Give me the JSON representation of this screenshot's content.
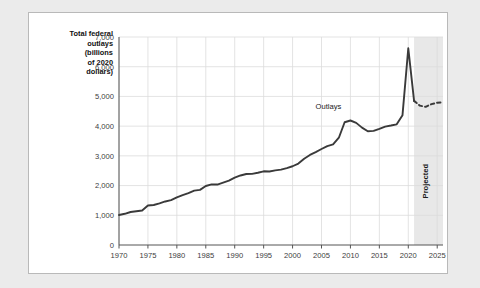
{
  "figure": {
    "y_axis_title": [
      "Total federal",
      "outlays",
      "(billions",
      "of 2020",
      "dollars)"
    ],
    "series_annotation": "Outlays",
    "projected_annotation": "Projected",
    "line_color": "#3a3a3a",
    "grid_color": "#dcdcdc",
    "shade_color": "#e8e8e8",
    "axis_color": "#555555"
  },
  "chart_data": {
    "type": "line",
    "title": "",
    "xlabel": "",
    "ylabel": "Total federal outlays (billions of 2020 dollars)",
    "xlim": [
      1970,
      2026
    ],
    "ylim": [
      0,
      7000
    ],
    "yticks": [
      "0",
      "1,000",
      "2,000",
      "3,000",
      "4,000",
      "5,000",
      "6,000",
      "7,000"
    ],
    "ytick_values": [
      0,
      1000,
      2000,
      3000,
      4000,
      5000,
      6000,
      7000
    ],
    "xticks": [
      "1970",
      "1975",
      "1980",
      "1985",
      "1990",
      "1995",
      "2000",
      "2005",
      "2010",
      "2015",
      "2020",
      "2025"
    ],
    "xtick_values": [
      1970,
      1975,
      1980,
      1985,
      1990,
      1995,
      2000,
      2005,
      2010,
      2015,
      2020,
      2025
    ],
    "grid": true,
    "legend": false,
    "projected_start": 2021,
    "series": [
      {
        "name": "Outlays",
        "style": "solid",
        "x": [
          1970,
          1971,
          1972,
          1973,
          1974,
          1975,
          1976,
          1977,
          1978,
          1979,
          1980,
          1981,
          1982,
          1983,
          1984,
          1985,
          1986,
          1987,
          1988,
          1989,
          1990,
          1991,
          1992,
          1993,
          1994,
          1995,
          1996,
          1997,
          1998,
          1999,
          2000,
          2001,
          2002,
          2003,
          2004,
          2005,
          2006,
          2007,
          2008,
          2009,
          2010,
          2011,
          2012,
          2013,
          2014,
          2015,
          2016,
          2017,
          2018,
          2019,
          2020,
          2021
        ],
        "values": [
          1010,
          1050,
          1110,
          1135,
          1160,
          1330,
          1345,
          1400,
          1465,
          1510,
          1605,
          1680,
          1745,
          1830,
          1855,
          1985,
          2040,
          2035,
          2100,
          2165,
          2265,
          2340,
          2390,
          2395,
          2430,
          2480,
          2475,
          2510,
          2535,
          2590,
          2650,
          2740,
          2900,
          3030,
          3125,
          3230,
          3330,
          3385,
          3610,
          4130,
          4190,
          4110,
          3950,
          3830,
          3840,
          3910,
          3985,
          4020,
          4060,
          4370,
          6620,
          4850
        ]
      },
      {
        "name": "Outlays (projected)",
        "style": "dashed",
        "x": [
          2021,
          2022,
          2023,
          2024,
          2025,
          2026
        ],
        "values": [
          4850,
          4690,
          4650,
          4740,
          4790,
          4800
        ]
      }
    ]
  }
}
